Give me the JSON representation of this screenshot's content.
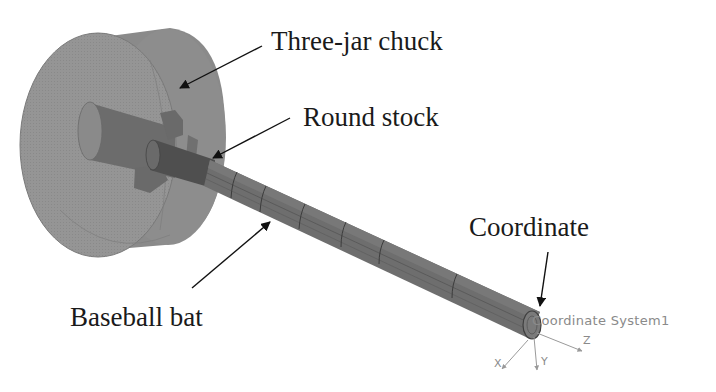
{
  "figure": {
    "callouts": [
      {
        "id": "chuck",
        "label": "Three-jar chuck"
      },
      {
        "id": "stock",
        "label": "Round stock"
      },
      {
        "id": "bat",
        "label": "Baseball bat"
      },
      {
        "id": "coord",
        "label": "Coordinate"
      }
    ],
    "cad_annotation": "Coordinate System1",
    "axes": {
      "x": "X",
      "y": "Y",
      "z": "Z"
    },
    "colors": {
      "chuck_body": "#8c8c8c",
      "chuck_face": "#979797",
      "shaft": "#6e6e6e",
      "shaft_dark": "#555555",
      "jaws": "#6a6a6a",
      "arrow": "#111111",
      "cad_text": "#8a8a8a"
    }
  }
}
